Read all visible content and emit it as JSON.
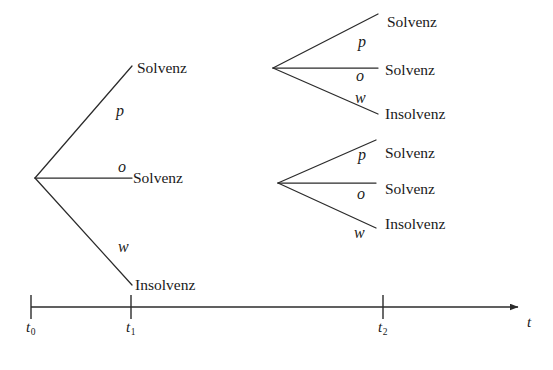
{
  "diagram": {
    "type": "event-tree",
    "stroke_color": "#2b2b2b",
    "text_color": "#1a1a1a",
    "background_color": "#ffffff",
    "outcomes": {
      "solvent": "Solvenz",
      "insolvent": "Insolvenz"
    },
    "probabilities": {
      "up": "p",
      "middle": "o",
      "down": "w"
    },
    "stage1": {
      "root": {
        "x": 35,
        "y": 178
      },
      "branches": [
        {
          "id": "s1-up",
          "prob": "p",
          "outcome": "Solvenz",
          "end_x": 132,
          "end_y": 66,
          "prob_x": 116,
          "prob_y": 103,
          "label_x": 137,
          "label_y": 60
        },
        {
          "id": "s1-mid",
          "prob": "o",
          "outcome": "Solvenz",
          "end_x": 132,
          "end_y": 178,
          "prob_x": 118,
          "prob_y": 159,
          "label_x": 133,
          "label_y": 170
        },
        {
          "id": "s1-down",
          "prob": "w",
          "outcome": "Insolvenz",
          "end_x": 132,
          "end_y": 285,
          "prob_x": 118,
          "prob_y": 239,
          "label_x": 135,
          "label_y": 277
        }
      ]
    },
    "stage2_upper": {
      "root": {
        "x": 273,
        "y": 68
      },
      "branches": [
        {
          "id": "s2u-up",
          "prob": "p",
          "outcome": "Solvenz",
          "end_x": 378,
          "end_y": 14,
          "prob_x": 358,
          "prob_y": 34,
          "label_x": 387,
          "label_y": 14
        },
        {
          "id": "s2u-mid",
          "prob": "o",
          "outcome": "Solvenz",
          "end_x": 378,
          "end_y": 68,
          "prob_x": 356,
          "prob_y": 68,
          "label_x": 385,
          "label_y": 62
        },
        {
          "id": "s2u-down",
          "prob": "w",
          "outcome": "Insolvenz",
          "end_x": 378,
          "end_y": 114,
          "prob_x": 355,
          "prob_y": 90,
          "label_x": 385,
          "label_y": 106
        }
      ]
    },
    "stage2_lower": {
      "root": {
        "x": 278,
        "y": 183
      },
      "branches": [
        {
          "id": "s2l-up",
          "prob": "p",
          "outcome": "Solvenz",
          "end_x": 376,
          "end_y": 140,
          "prob_x": 358,
          "prob_y": 147,
          "label_x": 385,
          "label_y": 145
        },
        {
          "id": "s2l-mid",
          "prob": "o",
          "outcome": "Solvenz",
          "end_x": 376,
          "end_y": 183,
          "prob_x": 357,
          "prob_y": 186,
          "label_x": 385,
          "label_y": 181
        },
        {
          "id": "s2l-down",
          "prob": "w",
          "outcome": "Insolvenz",
          "end_x": 376,
          "end_y": 228,
          "prob_x": 354,
          "prob_y": 225,
          "label_x": 385,
          "label_y": 216
        }
      ]
    },
    "time_axis": {
      "y": 307,
      "start_x": 31,
      "end_x": 518,
      "arrow": true,
      "axis_label": "t",
      "axis_label_x": 527,
      "axis_label_y": 315,
      "ticks": [
        {
          "id": "t0",
          "x": 31,
          "base": "t",
          "sub": "0",
          "label_x": 26,
          "label_y": 320
        },
        {
          "id": "t1",
          "x": 131,
          "base": "t",
          "sub": "1",
          "label_x": 126,
          "label_y": 320
        },
        {
          "id": "t2",
          "x": 383,
          "base": "t",
          "sub": "2",
          "label_x": 378,
          "label_y": 320
        }
      ]
    }
  }
}
